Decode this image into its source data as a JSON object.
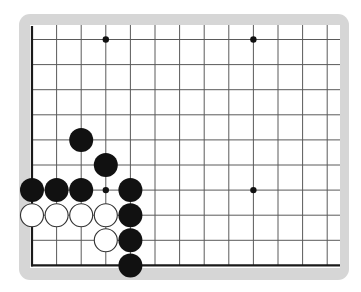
{
  "board": {
    "title": "Go board diagram (lower-left corner region)",
    "columns": 13,
    "rows": 10,
    "edges": {
      "left": true,
      "bottom": true,
      "top": false,
      "right": false
    },
    "colors": {
      "frame": "#d6d6d6",
      "board": "#ffffff",
      "grid_line": "#5a5a5a",
      "edge_line": "#1a1a1a",
      "black_stone": "#111111",
      "white_stone_fill": "#ffffff",
      "white_stone_outline": "#333333"
    },
    "hoshi": [
      {
        "col": 3,
        "row": 0
      },
      {
        "col": 9,
        "row": 0
      },
      {
        "col": 3,
        "row": 6
      },
      {
        "col": 9,
        "row": 6
      }
    ],
    "stones": [
      {
        "color": "black",
        "col": 2,
        "row": 4
      },
      {
        "color": "black",
        "col": 3,
        "row": 5
      },
      {
        "color": "black",
        "col": 0,
        "row": 6
      },
      {
        "color": "black",
        "col": 1,
        "row": 6
      },
      {
        "color": "black",
        "col": 2,
        "row": 6
      },
      {
        "color": "black",
        "col": 4,
        "row": 6
      },
      {
        "color": "white",
        "col": 0,
        "row": 7
      },
      {
        "color": "white",
        "col": 1,
        "row": 7
      },
      {
        "color": "white",
        "col": 2,
        "row": 7
      },
      {
        "color": "white",
        "col": 3,
        "row": 7
      },
      {
        "color": "black",
        "col": 4,
        "row": 7
      },
      {
        "color": "white",
        "col": 3,
        "row": 8
      },
      {
        "color": "black",
        "col": 4,
        "row": 8
      },
      {
        "color": "black",
        "col": 4,
        "row": 9
      }
    ]
  }
}
